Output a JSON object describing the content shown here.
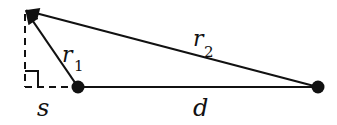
{
  "diagram": {
    "type": "geometry",
    "colors": {
      "stroke": "#111111",
      "background": "#ffffff"
    },
    "points": {
      "tip": [
        25,
        10
      ],
      "source1": [
        78,
        87
      ],
      "source2": [
        318,
        87
      ],
      "foot": [
        25,
        87
      ]
    },
    "labels": {
      "r1": {
        "main": "r",
        "sub": "1"
      },
      "r2": {
        "main": "r",
        "sub": "2"
      },
      "s": "s",
      "d": "d"
    },
    "elements": [
      {
        "name": "vector-r1",
        "from": "source1",
        "to": "tip",
        "style": "solid-arrow"
      },
      {
        "name": "vector-r2",
        "from": "source2",
        "to": "tip",
        "style": "solid-arrow"
      },
      {
        "name": "segment-d",
        "from": "source1",
        "to": "source2",
        "style": "solid"
      },
      {
        "name": "segment-s",
        "from": "foot",
        "to": "source1",
        "style": "dashed"
      },
      {
        "name": "perpendicular",
        "from": "foot",
        "to": "tip",
        "style": "dashed"
      },
      {
        "name": "right-angle-marker",
        "at": "foot"
      }
    ]
  }
}
